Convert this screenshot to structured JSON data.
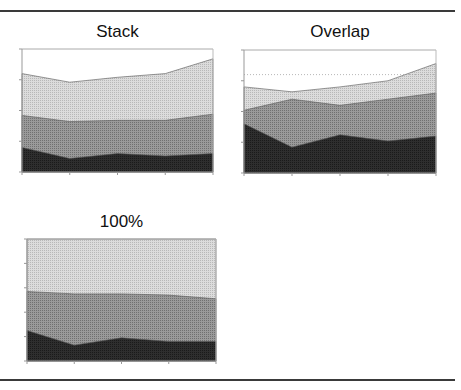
{
  "figure": {
    "panels": [
      {
        "title": "Stack"
      },
      {
        "title": "Overlap"
      },
      {
        "title": "100%"
      }
    ]
  },
  "colors": {
    "series_dark": "#2a2a2a",
    "series_medium": "#8a8a8a",
    "series_light": "#cfcfcf",
    "axis": "#888888",
    "rule": "#3a3a3a"
  },
  "chart_data": [
    {
      "type": "area",
      "title": "Stack",
      "mode": "stacked",
      "categories": [
        "1",
        "2",
        "3",
        "4",
        "5"
      ],
      "series": [
        {
          "name": "Series 1",
          "values": [
            20,
            11,
            15,
            13,
            15
          ]
        },
        {
          "name": "Series 2",
          "values": [
            26,
            30,
            27,
            29,
            32
          ]
        },
        {
          "name": "Series 3",
          "values": [
            34,
            32,
            35,
            38,
            45
          ]
        }
      ],
      "xlabel": "",
      "ylabel": "",
      "ylim": [
        0,
        100
      ],
      "y_ticks": 4,
      "grid": false,
      "legend": "none"
    },
    {
      "type": "area",
      "title": "Overlap",
      "mode": "overlap",
      "categories": [
        "1",
        "2",
        "3",
        "4",
        "5"
      ],
      "series": [
        {
          "name": "Series 1",
          "values": [
            40,
            21,
            31,
            26,
            30
          ]
        },
        {
          "name": "Series 2",
          "values": [
            51,
            60,
            55,
            60,
            65
          ]
        },
        {
          "name": "Series 3",
          "values": [
            70,
            66,
            70,
            75,
            89
          ]
        }
      ],
      "xlabel": "",
      "ylabel": "",
      "ylim": [
        0,
        100
      ],
      "y_ticks": 4,
      "grid": "dotted line at 80",
      "legend": "none"
    },
    {
      "type": "area",
      "title": "100%",
      "mode": "percent",
      "categories": [
        "1",
        "2",
        "3",
        "4",
        "5"
      ],
      "series": [
        {
          "name": "Series 1",
          "values": [
            25,
            13,
            19,
            16,
            16
          ]
        },
        {
          "name": "Series 2",
          "values": [
            32,
            42,
            36,
            38,
            35
          ]
        },
        {
          "name": "Series 3",
          "values": [
            43,
            45,
            45,
            46,
            49
          ]
        }
      ],
      "xlabel": "",
      "ylabel": "",
      "ylim": [
        0,
        100
      ],
      "y_ticks": 5,
      "grid": false,
      "legend": "none"
    }
  ]
}
